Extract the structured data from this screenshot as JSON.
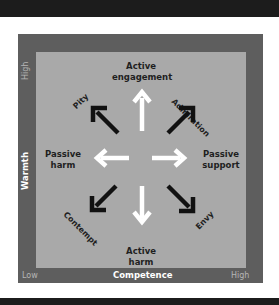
{
  "diagram": {
    "title": "",
    "axes": {
      "y": {
        "title": "Warmth",
        "high": "High"
      },
      "x": {
        "title": "Competence",
        "low": "Low",
        "high": "High"
      }
    },
    "labels": {
      "top": [
        "Active",
        "engagement"
      ],
      "bottom": [
        "Active",
        "harm"
      ],
      "left": [
        "Passive",
        "harm"
      ],
      "right": [
        "Passive",
        "support"
      ],
      "top_left": "Pity",
      "top_right": "Admiration",
      "bottom_left": "Contempt",
      "bottom_right": "Envy"
    },
    "arrows": [
      {
        "direction": "up",
        "color": "white"
      },
      {
        "direction": "down",
        "color": "white"
      },
      {
        "direction": "left",
        "color": "white"
      },
      {
        "direction": "right",
        "color": "white"
      },
      {
        "direction": "up-left",
        "color": "black"
      },
      {
        "direction": "up-right",
        "color": "black"
      },
      {
        "direction": "down-left",
        "color": "black"
      },
      {
        "direction": "down-right",
        "color": "black"
      }
    ],
    "colors": {
      "frame": "#5e5e5e",
      "panel": "#a9a9a9",
      "strip": "#1c1c1c",
      "white_arrow": "#ffffff",
      "black_arrow": "#111111"
    }
  }
}
